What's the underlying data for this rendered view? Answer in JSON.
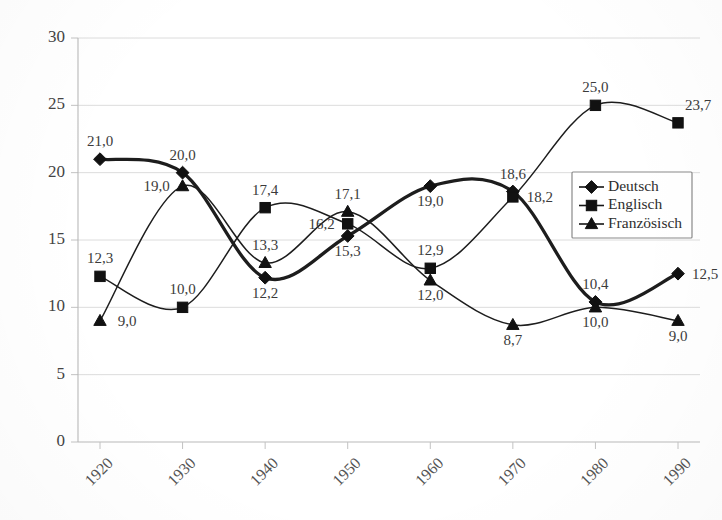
{
  "chart_data": {
    "type": "line",
    "title": "",
    "xlabel": "",
    "ylabel": "",
    "categories": [
      "1920",
      "1930",
      "1940",
      "1950",
      "1960",
      "1970",
      "1980",
      "1990"
    ],
    "ylim": [
      0,
      30
    ],
    "yticks": [
      "0",
      "5",
      "10",
      "15",
      "20",
      "25",
      "30"
    ],
    "grid": true,
    "legend_position": "middle-right",
    "smoothing": "spline",
    "decimal_separator": ",",
    "series": [
      {
        "name": "Deutsch",
        "marker": "diamond",
        "line_weight": "thick",
        "values": [
          21.0,
          20.0,
          12.2,
          15.3,
          19.0,
          18.6,
          10.4,
          12.5
        ],
        "labels": [
          "21,0",
          "20,0",
          "12,2",
          "15,3",
          "19,0",
          "18,6",
          "10,4",
          "12,5"
        ],
        "label_positions": [
          "above",
          "above",
          "below",
          "below",
          "below",
          "above",
          "above",
          "right"
        ]
      },
      {
        "name": "Englisch",
        "marker": "square",
        "line_weight": "thin",
        "values": [
          12.3,
          10.0,
          17.4,
          16.2,
          12.9,
          18.2,
          25.0,
          23.7
        ],
        "labels": [
          "12,3",
          "10,0",
          "17,4",
          "16,2",
          "12,9",
          "18,2",
          "25,0",
          "23,7"
        ],
        "label_positions": [
          "above",
          "above",
          "above",
          "left",
          "above",
          "right",
          "above",
          "above-right"
        ]
      },
      {
        "name": "Französisch",
        "marker": "triangle",
        "line_weight": "thin",
        "values": [
          9.0,
          19.0,
          13.3,
          17.1,
          12.0,
          8.7,
          10.0,
          9.0
        ],
        "labels": [
          "9,0",
          "19,0",
          "13,3",
          "17,1",
          "12,0",
          "8,7",
          "10,0",
          "9,0"
        ],
        "label_positions": [
          "right",
          "left",
          "above",
          "above",
          "below",
          "below",
          "below",
          "below"
        ]
      }
    ]
  },
  "colors": {
    "ink": "#1d1d1d",
    "gridline": "#dcdcdc",
    "axis": "#b9b9b9",
    "background": "#ffffff"
  }
}
